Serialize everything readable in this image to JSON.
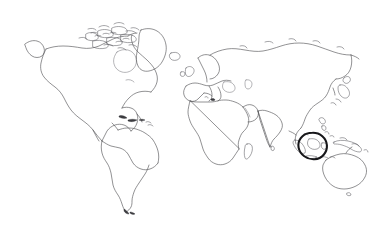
{
  "figure": {
    "name": "world-map-outline",
    "title": "World map outline with circled region",
    "background_color": "#ffffff",
    "width": 369,
    "height": 229,
    "caption": "",
    "style": "line-art coastline outline, no fill, no labels, no graticule",
    "outline_color": "#4e4e52",
    "annotation_color": "#17171a"
  },
  "annotation": {
    "type": "hand-drawn-ellipse",
    "label": "",
    "region_name": "Indonesia / Maritime Southeast Asia",
    "center_x": 312,
    "center_y": 146,
    "radius_x": 14.5,
    "radius_y": 13.0,
    "stroke_color": "#17171a",
    "stroke_width": 2.1
  },
  "landmasses": [
    {
      "name": "North America",
      "visible": true
    },
    {
      "name": "Greenland",
      "visible": true
    },
    {
      "name": "South America",
      "visible": true
    },
    {
      "name": "Europe",
      "visible": true
    },
    {
      "name": "Africa",
      "visible": true
    },
    {
      "name": "Asia",
      "visible": true
    },
    {
      "name": "Australia",
      "visible": true
    },
    {
      "name": "Japan",
      "visible": true
    },
    {
      "name": "Madagascar",
      "visible": true
    },
    {
      "name": "New Zealand",
      "visible": true
    },
    {
      "name": "Indonesia",
      "visible": true
    },
    {
      "name": "Philippines",
      "visible": true
    },
    {
      "name": "New Guinea",
      "visible": true
    },
    {
      "name": "British Isles",
      "visible": true
    },
    {
      "name": "Iceland",
      "visible": true
    },
    {
      "name": "Caribbean Islands",
      "visible": true
    },
    {
      "name": "Canadian Arctic Archipelago",
      "visible": true
    },
    {
      "name": "Antarctica",
      "visible": false
    }
  ],
  "legend": {
    "present": false,
    "entries": []
  },
  "axes": {
    "present": false,
    "graticule": false,
    "labels": []
  }
}
